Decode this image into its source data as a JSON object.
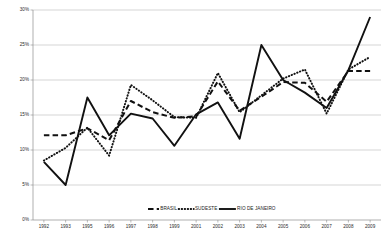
{
  "chart_data": {
    "type": "line",
    "title": "",
    "xlabel": "",
    "ylabel": "",
    "x": [
      1992,
      1993,
      1995,
      1996,
      1997,
      1998,
      1999,
      2001,
      2002,
      2003,
      2004,
      2005,
      2006,
      2007,
      2008,
      2009
    ],
    "categories": [
      "1992",
      "1993",
      "1995",
      "1996",
      "1997",
      "1998",
      "1999",
      "2001",
      "2002",
      "2003",
      "2004",
      "2005",
      "2006",
      "2007",
      "2008",
      "2009"
    ],
    "ylim": [
      0,
      30
    ],
    "ytick_labels": [
      "0%",
      "5%",
      "10%",
      "15%",
      "20%",
      "25%",
      "30%"
    ],
    "ytick_values": [
      0,
      5,
      10,
      15,
      20,
      25,
      30
    ],
    "grid": true,
    "legend_position": "inside-bottom-center",
    "series": [
      {
        "name": "BRASIL",
        "style": "dashed",
        "color": "#111111",
        "values": [
          12.1,
          12.1,
          13.1,
          11.4,
          17.0,
          15.4,
          14.6,
          14.8,
          19.8,
          15.6,
          17.6,
          19.7,
          19.6,
          16.9,
          21.3,
          21.3
        ]
      },
      {
        "name": "SUDESTE",
        "style": "dotted",
        "color": "#111111",
        "values": [
          8.5,
          10.3,
          13.2,
          9.2,
          19.3,
          17.1,
          14.7,
          14.6,
          21.0,
          15.4,
          17.8,
          20.2,
          21.5,
          15.2,
          21.5,
          23.3
        ]
      },
      {
        "name": "RIO DE JANEIRO",
        "style": "solid",
        "color": "#111111",
        "values": [
          8.3,
          5.0,
          17.5,
          12.1,
          15.2,
          14.5,
          10.6,
          15.1,
          16.8,
          11.6,
          25.0,
          20.0,
          18.2,
          16.0,
          21.4,
          29.0
        ]
      }
    ],
    "legend": [
      {
        "label": "BRASIL",
        "style": "dashed"
      },
      {
        "label": "SUDESTE",
        "style": "dotted"
      },
      {
        "label": "RIO DE JANEIRO",
        "style": "solid"
      }
    ]
  }
}
